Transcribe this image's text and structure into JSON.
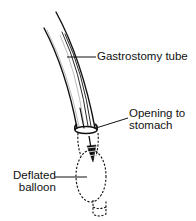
{
  "diagram": {
    "colors": {
      "line": "#111111",
      "background": "#ffffff"
    },
    "labels": {
      "tube": {
        "line1": "Gastrostomy tube"
      },
      "opening": {
        "line1": "Opening to",
        "line2": "stomach"
      },
      "balloon": {
        "line1": "Deflated",
        "line2": "balloon"
      }
    }
  }
}
